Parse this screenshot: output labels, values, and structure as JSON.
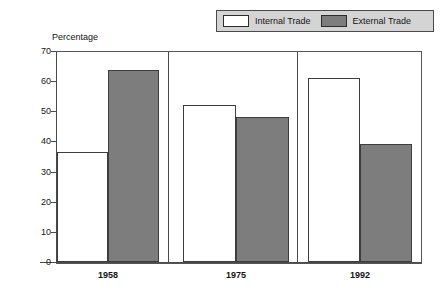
{
  "legend": {
    "position": "top-right",
    "entries": [
      {
        "label": "Internal Trade",
        "color": "#ffffff",
        "icon": "legend-swatch-internal"
      },
      {
        "label": "External Trade",
        "color": "#7d7d7d",
        "icon": "legend-swatch-external"
      }
    ]
  },
  "axis": {
    "y_title": "Percentage",
    "tick_labels": [
      "70",
      "60",
      "50",
      "40",
      "30",
      "20",
      "10",
      "0"
    ]
  },
  "chart_data": {
    "type": "bar",
    "title": "",
    "subtitle": "",
    "xlabel": "",
    "ylabel": "Percentage",
    "categories": [
      "1958",
      "1975",
      "1992"
    ],
    "series": [
      {
        "name": "Internal Trade",
        "color": "#ffffff",
        "values": [
          36.5,
          52.2,
          61.0
        ]
      },
      {
        "name": "External Trade",
        "color": "#7d7d7d",
        "values": [
          63.8,
          48.0,
          39.2
        ]
      }
    ],
    "ylim": [
      0,
      70
    ],
    "ytick_interval": 10,
    "grid": false,
    "legend_position": "top-right",
    "group_separators": true,
    "annotations": []
  }
}
